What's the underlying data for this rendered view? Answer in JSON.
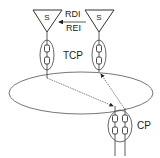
{
  "diagram": {
    "labels": {
      "source_left": "S",
      "source_right": "S",
      "rdi": "RDI",
      "rei": "REI",
      "tcp": "TCP",
      "cp": "CP"
    },
    "colors": {
      "stroke": "#333333",
      "background": "#ffffff",
      "ellipse": "#555555"
    }
  }
}
